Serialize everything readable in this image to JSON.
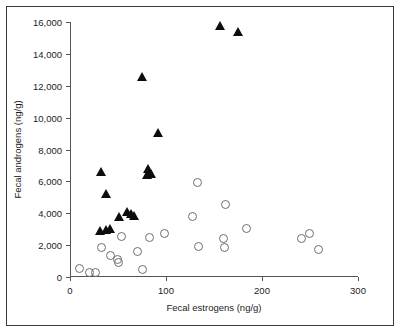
{
  "chart_data": {
    "type": "scatter",
    "title": "",
    "xlabel": "Fecal estrogens (ng/g)",
    "ylabel": "Fecal androgens (ng/g)",
    "xlim": [
      0,
      300
    ],
    "ylim": [
      0,
      16000
    ],
    "xticks": [
      0,
      100,
      200,
      300
    ],
    "xtick_labels": [
      "0",
      "100",
      "200",
      "300"
    ],
    "yticks": [
      0,
      2000,
      4000,
      6000,
      8000,
      10000,
      12000,
      14000,
      16000
    ],
    "ytick_labels": [
      "0",
      "2,000",
      "4,000",
      "6,000",
      "8,000",
      "10,000",
      "12,000",
      "14,000",
      "16,000"
    ],
    "grid": false,
    "legend_position": "none",
    "series": [
      {
        "name": "filled-triangles",
        "marker": "triangle",
        "color": "#0d0d0d",
        "points": [
          [
            33,
            6600
          ],
          [
            38,
            5250
          ],
          [
            32,
            2900
          ],
          [
            38,
            3000
          ],
          [
            42,
            3050
          ],
          [
            52,
            3800
          ],
          [
            60,
            4100
          ],
          [
            64,
            4000
          ],
          [
            67,
            3850
          ],
          [
            75,
            12550
          ],
          [
            81,
            6450
          ],
          [
            82,
            6800
          ],
          [
            85,
            6500
          ],
          [
            92,
            9050
          ],
          [
            157,
            15750
          ],
          [
            176,
            15400
          ]
        ]
      },
      {
        "name": "open-circles",
        "marker": "circle",
        "color": "#6e6e6e",
        "points": [
          [
            10,
            560
          ],
          [
            20,
            300
          ],
          [
            27,
            300
          ],
          [
            33,
            1820
          ],
          [
            42,
            1370
          ],
          [
            49,
            1100
          ],
          [
            51,
            900
          ],
          [
            54,
            2560
          ],
          [
            70,
            1600
          ],
          [
            76,
            440
          ],
          [
            83,
            2500
          ],
          [
            98,
            2760
          ],
          [
            128,
            3780
          ],
          [
            133,
            5950
          ],
          [
            134,
            1920
          ],
          [
            160,
            2400
          ],
          [
            161,
            1840
          ],
          [
            162,
            4520
          ],
          [
            184,
            3050
          ],
          [
            241,
            2400
          ],
          [
            249,
            2700
          ],
          [
            259,
            1720
          ]
        ]
      }
    ]
  }
}
